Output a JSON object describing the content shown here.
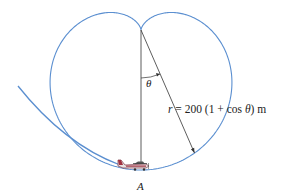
{
  "figure": {
    "type": "cardioid flight path",
    "labels": {
      "theta": "θ",
      "equation_r": "r",
      "equation_rest": " = 200 (1 + cos ",
      "equation_theta": "θ",
      "equation_end": ") m",
      "point": "A"
    },
    "colors": {
      "path": "#5b8fd0",
      "lines": "#333333",
      "plane_body": "#e8e0e0",
      "plane_accent": "#a03040"
    }
  }
}
